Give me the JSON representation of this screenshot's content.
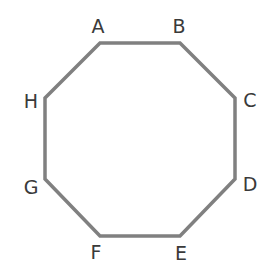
{
  "diagram": {
    "type": "regular-octagon",
    "stroke_color": "#808080",
    "stroke_width": 3.5,
    "label_color": "#3a3a3a",
    "vertices": [
      {
        "label": "A",
        "x": 100,
        "y": 43,
        "lx": 98,
        "ly": 33,
        "anchor": "middle"
      },
      {
        "label": "B",
        "x": 180,
        "y": 43,
        "lx": 179,
        "ly": 33,
        "anchor": "middle"
      },
      {
        "label": "C",
        "x": 235,
        "y": 98,
        "lx": 250,
        "ly": 107,
        "anchor": "middle"
      },
      {
        "label": "D",
        "x": 235,
        "y": 179,
        "lx": 250,
        "ly": 191,
        "anchor": "middle"
      },
      {
        "label": "E",
        "x": 180,
        "y": 236,
        "lx": 181,
        "ly": 260,
        "anchor": "middle"
      },
      {
        "label": "F",
        "x": 100,
        "y": 236,
        "lx": 96,
        "ly": 259,
        "anchor": "middle"
      },
      {
        "label": "G",
        "x": 45,
        "y": 179,
        "lx": 31,
        "ly": 194,
        "anchor": "middle"
      },
      {
        "label": "H",
        "x": 45,
        "y": 98,
        "lx": 31,
        "ly": 108,
        "anchor": "middle"
      }
    ]
  }
}
